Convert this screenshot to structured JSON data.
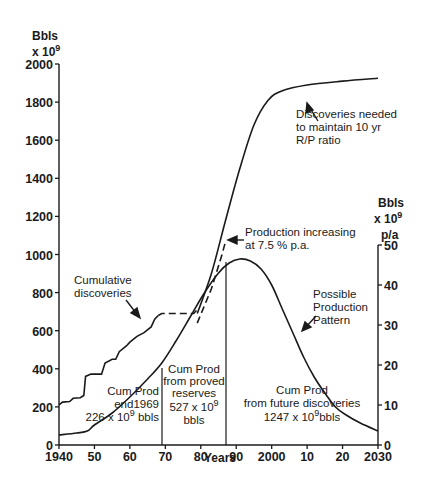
{
  "chart_data": {
    "type": "line",
    "title": "",
    "xlabel": "Years",
    "ylabel_left": "Bbls x 10^9",
    "ylabel_right": "Bbls x 10^9 p/a",
    "xlim": [
      1940,
      2030
    ],
    "ylim_left": [
      0,
      2000
    ],
    "ylim_right": [
      0,
      50
    ],
    "grid": false,
    "x_ticks": [
      "1940",
      "50",
      "60",
      "70",
      "80",
      "90",
      "2000",
      "10",
      "20",
      "2030"
    ],
    "y_ticks_left": [
      "0",
      "200",
      "400",
      "600",
      "800",
      "1000",
      "1200",
      "1400",
      "1600",
      "1800",
      "2000"
    ],
    "y_ticks_right": [
      "0",
      "10",
      "20",
      "30",
      "40",
      "50"
    ],
    "series": [
      {
        "name": "Cumulative discoveries",
        "axis": "left",
        "style": "solid-staircase",
        "points": [
          [
            1940,
            210
          ],
          [
            1941,
            225
          ],
          [
            1943,
            228
          ],
          [
            1944,
            245
          ],
          [
            1946,
            248
          ],
          [
            1947,
            260
          ],
          [
            1947.5,
            360
          ],
          [
            1949,
            372
          ],
          [
            1952,
            372
          ],
          [
            1953,
            430
          ],
          [
            1955,
            450
          ],
          [
            1956,
            450
          ],
          [
            1957,
            490
          ],
          [
            1959,
            520
          ],
          [
            1960,
            540
          ],
          [
            1962,
            570
          ],
          [
            1964,
            590
          ],
          [
            1966,
            620
          ],
          [
            1967,
            660
          ],
          [
            1968,
            680
          ]
        ]
      },
      {
        "name": "Cumulative discoveries (plateau, projected)",
        "axis": "left",
        "style": "dashed",
        "points": [
          [
            1968,
            680
          ],
          [
            1969,
            690
          ],
          [
            1978,
            690
          ],
          [
            1979,
            710
          ]
        ]
      },
      {
        "name": "Discoveries needed to maintain 10 yr R/P ratio",
        "axis": "left",
        "style": "solid",
        "points": [
          [
            1979,
            690
          ],
          [
            1983,
            900
          ],
          [
            1987,
            1180
          ],
          [
            1991,
            1450
          ],
          [
            1995,
            1680
          ],
          [
            1999,
            1810
          ],
          [
            2003,
            1860
          ],
          [
            2010,
            1890
          ],
          [
            2020,
            1910
          ],
          [
            2030,
            1925
          ]
        ]
      },
      {
        "name": "Production increasing at 7.5% p.a.",
        "axis": "left",
        "style": "dashed",
        "points": [
          [
            1979,
            640
          ],
          [
            1983,
            820
          ],
          [
            1986,
            1000
          ],
          [
            1987,
            1070
          ]
        ]
      },
      {
        "name": "Production (historical + possible pattern)",
        "axis": "right",
        "style": "solid",
        "points": [
          [
            1940,
            2.5
          ],
          [
            1945,
            3
          ],
          [
            1948,
            3.5
          ],
          [
            1950,
            5
          ],
          [
            1955,
            8
          ],
          [
            1960,
            12
          ],
          [
            1965,
            16.5
          ],
          [
            1969,
            20.5
          ],
          [
            1973,
            26
          ],
          [
            1977,
            32
          ],
          [
            1981,
            38
          ],
          [
            1985,
            43
          ],
          [
            1988,
            45.5
          ],
          [
            1991,
            46.5
          ],
          [
            1994,
            46
          ],
          [
            1997,
            44
          ],
          [
            2000,
            40
          ],
          [
            2003,
            34
          ],
          [
            2006,
            28
          ],
          [
            2009,
            22
          ],
          [
            2012,
            17
          ],
          [
            2015,
            13
          ],
          [
            2018,
            9.5
          ],
          [
            2021,
            7.5
          ],
          [
            2025,
            5.5
          ],
          [
            2030,
            3.5
          ]
        ]
      }
    ],
    "regions": [
      {
        "label": "Cum Prod end1969 226x10^9 bbls",
        "from": 1940,
        "to": 1969,
        "value_bbls_e9": 226
      },
      {
        "label": "Cum Prod from proved reserves 527x10^9 bbls",
        "from": 1969,
        "to": 1987,
        "value_bbls_e9": 527
      },
      {
        "label": "Cum Prod from future discoveries 1247x10^9 bbls",
        "from": 1987,
        "to": 2030,
        "value_bbls_e9": 1247
      }
    ],
    "annotations": [
      "Cumulative discoveries",
      "Discoveries needed to maintain 10 yr R/P ratio",
      "Production increasing at 7.5 % p.a.",
      "Possible Production Pattern"
    ]
  },
  "labels": {
    "left_unit_1": "Bbls",
    "left_unit_2": "x 10",
    "left_unit_exp": "9",
    "right_unit_1": "Bbls",
    "right_unit_2": "x 10",
    "right_unit_exp": "9",
    "right_unit_3": "p/a",
    "xlabel": "Years",
    "cum_disc_1": "Cumulative",
    "cum_disc_2": "discoveries",
    "needed_1": "Discoveries needed",
    "needed_2": "to maintain 10 yr",
    "needed_3": "R/P ratio",
    "prodinc_1": "Production increasing",
    "prodinc_2": "at 7.5 % p.a.",
    "possible_1": "Possible",
    "possible_2": "Production",
    "possible_3": "Pattern",
    "r1_1": "Cum  Prod",
    "r1_2": "end1969",
    "r1_3a": "226 x 10",
    "r1_3exp": "9",
    "r1_3b": " bbls",
    "r2_1": "Cum Prod",
    "r2_2": "from proved",
    "r2_3": "reserves",
    "r2_4a": "527 x 10",
    "r2_4exp": "9",
    "r2_5": "bbls",
    "r3_1": "Cum  Prod",
    "r3_2": "from  future  discoveries",
    "r3_3a": "1247 x 10",
    "r3_3exp": "9",
    "r3_3b": "bbls"
  }
}
